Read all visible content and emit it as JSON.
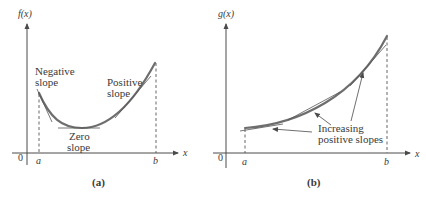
{
  "panels": [
    {
      "id": "a",
      "caption": "(a)",
      "y_axis_label": "f(x)",
      "x_axis_label": "x",
      "origin_label": "0",
      "x_ticks": [
        "a",
        "b"
      ],
      "annotations": {
        "negative_line1": "Negative",
        "negative_line2": "slope",
        "positive_line1": "Positive",
        "positive_line2": "slope",
        "zero_line1": "Zero",
        "zero_line2": "slope"
      }
    },
    {
      "id": "b",
      "caption": "(b)",
      "y_axis_label": "g(x)",
      "x_axis_label": "x",
      "origin_label": "0",
      "x_ticks": [
        "a",
        "b"
      ],
      "annotations": {
        "increasing_line1": "Increasing",
        "increasing_line2": "positive slopes"
      }
    }
  ],
  "colors": {
    "curve": "#6e6e6e",
    "axis": "#4a4a4a",
    "tangent": "#555555",
    "text": "#3a3a3a"
  }
}
